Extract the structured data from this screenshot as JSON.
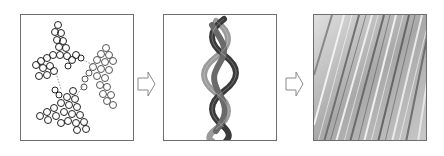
{
  "figure": {
    "stages": [
      {
        "id": "stage-1",
        "label": "",
        "content": "molecular structures (ball-and-stick clusters connected by dotted bonds)"
      },
      {
        "id": "stage-2",
        "label": "",
        "content": "triple-helix braided strand"
      },
      {
        "id": "stage-3",
        "label": "",
        "content": "micrograph of aligned fibrous texture"
      }
    ],
    "arrows": [
      {
        "from": "stage-1",
        "to": "stage-2",
        "style": "hollow block arrow"
      },
      {
        "from": "stage-2",
        "to": "stage-3",
        "style": "hollow block arrow"
      }
    ],
    "colors": {
      "border": "#6e6e6e",
      "arrow_stroke": "#8a8a8a",
      "helix_dark": "#3a3a3a",
      "helix_light": "#9a9a9a",
      "micrograph_base": "#bdbdbd"
    }
  }
}
